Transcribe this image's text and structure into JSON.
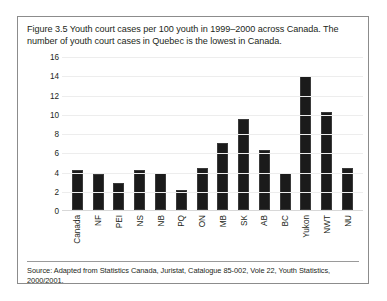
{
  "figure": {
    "caption": "Figure 3.5 Youth court cases per 100 youth in 1999–2000 across Canada. The number of youth court cases in Quebec is the lowest in Canada.",
    "source": "Source: Adapted from Statistics Canada, Juristat, Catalogue 85-002, Vole 22, Youth Statistics, 2000/2001."
  },
  "colors": {
    "bar": "#1b1b1b",
    "gridline": "#ededed",
    "border": "#8c8c8c",
    "text": "#231f20",
    "background": "#ffffff"
  },
  "chart_data": {
    "type": "bar",
    "title": "Figure 3.5 Youth court cases per 100 youth in 1999–2000 across Canada. The number of youth court cases in Quebec is the lowest in Canada.",
    "xlabel": "",
    "ylabel": "",
    "ylim": [
      0,
      16
    ],
    "yticks": [
      0,
      2,
      4,
      6,
      8,
      10,
      12,
      14,
      16
    ],
    "grid": true,
    "legend": false,
    "categories": [
      "Canada",
      "NF",
      "PEI",
      "NS",
      "NB",
      "PQ",
      "ON",
      "MB",
      "SK",
      "AB",
      "BC",
      "Yukon",
      "NWT",
      "NU"
    ],
    "values": [
      4.2,
      3.7,
      2.8,
      4.2,
      3.8,
      2.1,
      4.4,
      7.0,
      9.5,
      6.2,
      3.8,
      13.9,
      10.2,
      4.4
    ]
  }
}
